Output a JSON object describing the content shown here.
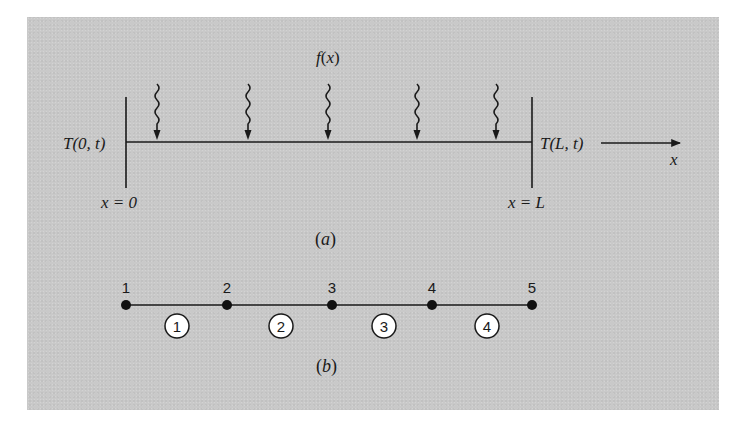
{
  "figure": {
    "background_color": "#c9c9c9",
    "ink_color": "#1a1a1a",
    "part_a": {
      "label": "(a)",
      "label_letter": "a",
      "source_label": "f(x)",
      "source_label_fn": "f",
      "source_label_arg": "x",
      "left_boundary_label": "T(0, t)",
      "right_boundary_label": "T(L, t)",
      "left_position_label": "x = 0",
      "right_position_label": "x = L",
      "axis_label": "x",
      "source_arrow_count": 5
    },
    "part_b": {
      "label": "(b)",
      "label_letter": "b",
      "nodes": [
        "1",
        "2",
        "3",
        "4",
        "5"
      ],
      "elements": [
        "1",
        "2",
        "3",
        "4"
      ]
    }
  }
}
